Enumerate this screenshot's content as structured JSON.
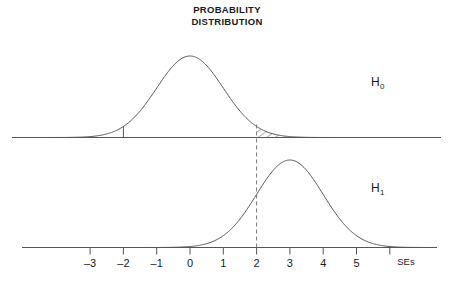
{
  "title": {
    "line1": "PROBABILITY",
    "line2": "DISTRIBUTION"
  },
  "labels": {
    "h0_base": "H",
    "h0_sub": "0",
    "h1_base": "H",
    "h1_sub": "1",
    "axis_unit": "SEs"
  },
  "axis": {
    "tick_labels": [
      "-3",
      "-2",
      "-1",
      "0",
      "1",
      "2",
      "3",
      "4",
      "5"
    ],
    "tick_values": [
      -3,
      -2,
      -1,
      0,
      1,
      2,
      3,
      4,
      5,
      6
    ],
    "labeled_count": 9,
    "range": [
      -4.8,
      7.4
    ],
    "unit": "SEs"
  },
  "colors": {
    "curve": "#555555",
    "axis": "#555555",
    "text": "#1a1a1a",
    "hatch": "#555555",
    "dashed": "#777777",
    "background": "#ffffff"
  },
  "chart_data": {
    "type": "line",
    "title": "PROBABILITY DISTRIBUTION",
    "xlabel": "SEs",
    "ylabel": "",
    "xlim": [
      -4.8,
      7.4
    ],
    "grid": false,
    "legend_position": "right",
    "series": [
      {
        "name": "H0",
        "label": "H₀",
        "distribution": "normal",
        "mean": 0,
        "sd": 1,
        "panel": "top",
        "peak_x": 0,
        "annotations": [
          {
            "type": "critical-tick",
            "x": -2,
            "description": "short vertical line from curve to baseline at -2 SEs"
          },
          {
            "type": "rejection-region",
            "x_start": 2,
            "x_end": 4.6,
            "fill": "diagonal-hatching",
            "description": "hatched upper tail area beyond 2 SEs"
          }
        ]
      },
      {
        "name": "H1",
        "label": "H₁",
        "distribution": "normal",
        "mean": 3,
        "sd": 1,
        "panel": "bottom",
        "peak_x": 3,
        "annotations": [
          {
            "type": "critical-line",
            "x": 2,
            "style": "dashed",
            "description": "dashed vertical line at 2 SEs spanning both panels"
          }
        ]
      }
    ]
  }
}
